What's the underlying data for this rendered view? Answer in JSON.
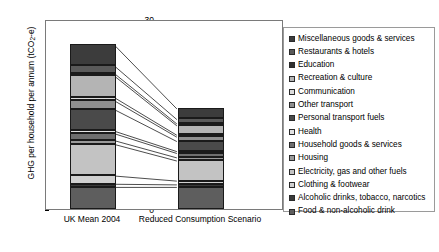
{
  "chart_data": {
    "type": "bar",
    "subtype": "stacked-column-with-connectors",
    "title": "",
    "xlabel": "",
    "ylabel": "GHG per household per annum (tCO2-e)",
    "ylabel_parts": {
      "pre": "GHG per household per annum (tCO",
      "sub": "2",
      "post": "-e)"
    },
    "ylim": [
      0,
      30
    ],
    "yticks": [
      0,
      5,
      10,
      15,
      20,
      25,
      30
    ],
    "grid": false,
    "legend_position": "right",
    "categories": [
      "UK Mean 2004",
      "Reduced Consumption Scenario"
    ],
    "series": [
      {
        "name": "Food & non-alcoholic drink",
        "color": "#5e5e5e",
        "values": [
          3.5,
          3.5
        ]
      },
      {
        "name": "Alcoholic drinks, tobacco, narcotics",
        "color": "#3a3a3a",
        "values": [
          0.5,
          0.4
        ]
      },
      {
        "name": "Clothing & footwear",
        "color": "#d0d0d0",
        "values": [
          1.3,
          0.6
        ]
      },
      {
        "name": "Electricity, gas and other fuels",
        "color": "#c3c3c3",
        "values": [
          5.0,
          3.2
        ]
      },
      {
        "name": "Housing",
        "color": "#9a9a9a",
        "values": [
          0.6,
          0.5
        ]
      },
      {
        "name": "Household goods & services",
        "color": "#6e6e6e",
        "values": [
          1.1,
          0.7
        ]
      },
      {
        "name": "Health",
        "color": "#e2e2e2",
        "values": [
          0.4,
          0.3
        ]
      },
      {
        "name": "Personal transport fuels",
        "color": "#4a4a4a",
        "values": [
          3.4,
          1.6
        ]
      },
      {
        "name": "Other transport",
        "color": "#8f8f8f",
        "values": [
          1.4,
          0.7
        ]
      },
      {
        "name": "Communication",
        "color": "#dcdcdc",
        "values": [
          0.5,
          0.3
        ]
      },
      {
        "name": "Recreation & culture",
        "color": "#b4b4b4",
        "values": [
          3.4,
          1.5
        ]
      },
      {
        "name": "Education",
        "color": "#2f2f2f",
        "values": [
          0.4,
          0.3
        ]
      },
      {
        "name": "Restaurants & hotels",
        "color": "#5a5a5a",
        "values": [
          1.2,
          0.7
        ]
      },
      {
        "name": "Miscellaneous goods & services",
        "color": "#3c3c3c",
        "values": [
          3.3,
          1.7
        ]
      }
    ],
    "totals": [
      26.0,
      16.0
    ],
    "legend_order": [
      "Miscellaneous goods & services",
      "Restaurants & hotels",
      "Education",
      "Recreation & culture",
      "Communication",
      "Other transport",
      "Personal transport fuels",
      "Health",
      "Household goods & services",
      "Housing",
      "Electricity, gas and other fuels",
      "Clothing & footwear",
      "Alcoholic drinks, tobacco, narcotics",
      "Food & non-alcoholic drink"
    ]
  },
  "legend": {
    "items": [
      {
        "label": "Miscellaneous goods & services",
        "color": "#3c3c3c"
      },
      {
        "label": "Restaurants & hotels",
        "color": "#5a5a5a"
      },
      {
        "label": "Education",
        "color": "#2f2f2f"
      },
      {
        "label": "Recreation & culture",
        "color": "#b4b4b4"
      },
      {
        "label": "Communication",
        "color": "#dcdcdc"
      },
      {
        "label": "Other transport",
        "color": "#8f8f8f"
      },
      {
        "label": "Personal transport fuels",
        "color": "#4a4a4a"
      },
      {
        "label": "Health",
        "color": "#e2e2e2"
      },
      {
        "label": "Household goods & services",
        "color": "#6e6e6e"
      },
      {
        "label": "Housing",
        "color": "#9a9a9a"
      },
      {
        "label": "Electricity, gas and other fuels",
        "color": "#c3c3c3"
      },
      {
        "label": "Clothing & footwear",
        "color": "#d0d0d0"
      },
      {
        "label": "Alcoholic drinks, tobacco, narcotics",
        "color": "#3a3a3a"
      },
      {
        "label": "Food & non-alcoholic drink",
        "color": "#5e5e5e"
      }
    ]
  }
}
